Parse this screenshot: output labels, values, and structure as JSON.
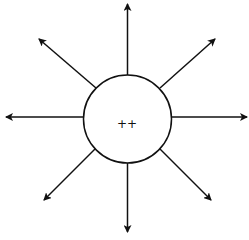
{
  "diagram": {
    "type": "radial-field",
    "center_label": "++",
    "circle": {
      "cx": 127.5,
      "cy": 119,
      "r": 44
    },
    "stroke_color": "#111111",
    "background": "#ffffff",
    "arrows": [
      {
        "name": "arrow-up",
        "x1": 127.5,
        "y1": 75,
        "x2": 127.5,
        "y2": 4
      },
      {
        "name": "arrow-down",
        "x1": 127.5,
        "y1": 163,
        "x2": 127.5,
        "y2": 232
      },
      {
        "name": "arrow-left",
        "x1": 83,
        "y1": 117,
        "x2": 6,
        "y2": 117
      },
      {
        "name": "arrow-right",
        "x1": 172,
        "y1": 117,
        "x2": 247,
        "y2": 117
      },
      {
        "name": "arrow-up-left",
        "x1": 96,
        "y1": 88,
        "x2": 39,
        "y2": 39
      },
      {
        "name": "arrow-up-right",
        "x1": 160,
        "y1": 88,
        "x2": 215,
        "y2": 39
      },
      {
        "name": "arrow-down-left",
        "x1": 95,
        "y1": 149,
        "x2": 44,
        "y2": 200
      },
      {
        "name": "arrow-down-right",
        "x1": 160,
        "y1": 149,
        "x2": 211,
        "y2": 200
      }
    ]
  }
}
